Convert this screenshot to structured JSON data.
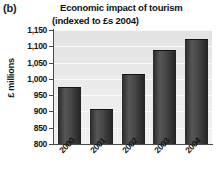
{
  "figure": {
    "panel_letter": "(b)",
    "title_line1": "Economic impact of tourism",
    "title_line2": "(indexed to £s 2004)"
  },
  "chart_data": {
    "type": "bar",
    "title": "Economic impact of tourism (indexed to £s 2004)",
    "title_line1": "Economic impact of tourism",
    "title_line2": "(indexed to £s 2004)",
    "xlabel": "",
    "ylabel": "£ millions",
    "categories": [
      "2000",
      "2001",
      "2002",
      "2003",
      "2004"
    ],
    "values": [
      975,
      908,
      1015,
      1090,
      1122
    ],
    "ylim": [
      800,
      1150
    ],
    "ytick_values": [
      800,
      850,
      900,
      950,
      1000,
      1050,
      1100,
      1150
    ],
    "ytick_labels": [
      "800",
      "850",
      "900",
      "950",
      "1,000",
      "1,050",
      "1,100",
      "1,150"
    ],
    "grid": true,
    "grid_axis": "y",
    "legend": false,
    "bar_color": "#3b3b3b",
    "plot_background": "#e8e8e8",
    "gridline_color": "#fbfbfb",
    "axis_color": "#4a4a4a"
  }
}
